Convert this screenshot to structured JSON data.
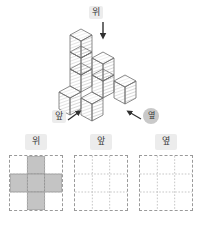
{
  "figure": {
    "title_top_label": "위",
    "title_front_label": "앞",
    "title_side_label": "옆",
    "arrow_top_name": "down-arrow-icon",
    "arrow_front_name": "up-right-arrow-icon",
    "arrow_side_name": "up-left-arrow-icon",
    "cube_count": 6,
    "cube_fill": "#d6d6d6",
    "cube_top_fill": "#e4e4e4",
    "cube_side_fill": "#bdbdbd",
    "cube_stroke": "#6e6e6e"
  },
  "chart_data": {
    "type": "table",
    "solid": {
      "representation": "height_map",
      "note": "grid[row][col] = number of cubes stacked at that base cell; row 0 is back, col 0 is left",
      "rows": 2,
      "cols": 3,
      "height_map": [
        [
          3,
          2,
          1
        ],
        [
          1,
          1,
          0
        ]
      ]
    },
    "panels": [
      {
        "label": "위",
        "view": "top",
        "grid_rows": 3,
        "grid_cols": 3,
        "filled": [
          [
            0,
            1
          ],
          [
            1,
            0
          ],
          [
            1,
            1
          ],
          [
            1,
            2
          ],
          [
            2,
            1
          ]
        ],
        "fill_color": "#c4c4c4",
        "filled_count": 5,
        "shape": "plus"
      },
      {
        "label": "앞",
        "view": "front",
        "grid_rows": 3,
        "grid_cols": 3,
        "filled": [],
        "fill_color": "#c4c4c4",
        "filled_count": 0,
        "shape": "empty"
      },
      {
        "label": "옆",
        "view": "side",
        "grid_rows": 3,
        "grid_cols": 3,
        "filled": [],
        "fill_color": "#c4c4c4",
        "filled_count": 0,
        "shape": "empty"
      }
    ],
    "grid_line_color": "#b9b9b9",
    "grid_border_style": "dashed",
    "xlabel": "",
    "ylabel": ""
  }
}
